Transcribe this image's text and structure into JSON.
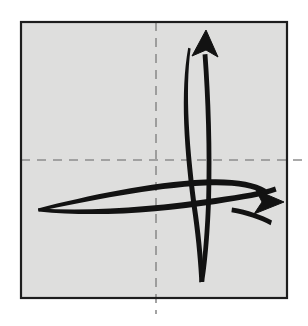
{
  "figure": {
    "type": "origami-fold-diagram",
    "title": "Origami step: square sheet with horizontal and vertical crease guides and two curved fold arrows",
    "canvas": {
      "width": 308,
      "height": 326,
      "background_color": "#ffffff"
    }
  },
  "paper": {
    "name": "square-sheet",
    "fill_color": "#dededd",
    "border_color": "#1d1d1d",
    "border_width": 2.2,
    "x": 21,
    "y": 22,
    "width": 266,
    "height": 276
  },
  "creases": [
    {
      "name": "horizontal-crease",
      "orientation": "horizontal",
      "style": "dashed",
      "color": "#8d8d8d",
      "dash_pattern": "9 7",
      "x1": 21,
      "y1": 160,
      "x2": 307,
      "y2": 160
    },
    {
      "name": "vertical-crease",
      "orientation": "vertical",
      "style": "dashed",
      "color": "#8d8d8d",
      "dash_pattern": "9 7",
      "x1": 156,
      "y1": 22,
      "x2": 156,
      "y2": 314
    }
  ],
  "arrows": [
    {
      "name": "upward-fold-arrow",
      "direction": "up",
      "color": "#121212",
      "tip": {
        "x": 206,
        "y": 30
      },
      "tail": {
        "x": 203,
        "y": 282
      },
      "stroke_count": 2,
      "head_points": "206,30 192,56 206,50 218,57"
    },
    {
      "name": "rightward-fold-arrow",
      "direction": "right",
      "color": "#121212",
      "tip": {
        "x": 284,
        "y": 202
      },
      "tail": {
        "x": 38,
        "y": 208
      },
      "stroke_count": 2,
      "head_points": "284,202 256,190 262,202 254,214"
    }
  ],
  "labels": {
    "figure_caption": "",
    "step_number": ""
  }
}
